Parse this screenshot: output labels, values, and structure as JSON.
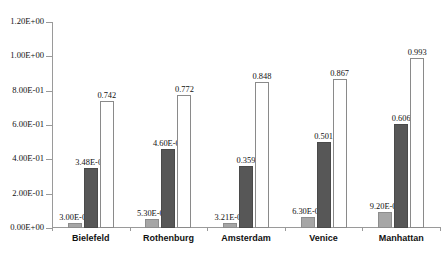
{
  "chart_data": {
    "type": "bar",
    "title": "",
    "xlabel": "",
    "ylabel": "",
    "ylim": [
      0,
      1.2
    ],
    "grid": false,
    "legend": "none",
    "categories": [
      "Bielefeld",
      "Rothenburg",
      "Amsterdam",
      "Venice",
      "Manhattan"
    ],
    "ytick_labels": [
      "1.20E+00",
      "1.00E+00",
      "8.00E-01",
      "6.00E-01",
      "4.00E-01",
      "2.00E-01",
      "0.00E+00"
    ],
    "ytick_values": [
      1.2,
      1.0,
      0.8,
      0.6,
      0.4,
      0.2,
      0.0
    ],
    "series": [
      {
        "name": "series-1",
        "color": "#a6a6a6",
        "values": [
          0.03,
          0.053,
          0.0321,
          0.063,
          0.092
        ],
        "labels": [
          "3.00E-02",
          "5.30E-02",
          "3.21E-02",
          "6.30E-02",
          "9.20E-02"
        ]
      },
      {
        "name": "series-2",
        "color": "#575757",
        "values": [
          0.348,
          0.46,
          0.359,
          0.501,
          0.606
        ],
        "labels": [
          "3.48E-01",
          "4.60E-01",
          "0.359",
          "0.501",
          "0.606"
        ]
      },
      {
        "name": "series-3",
        "color": "#ffffff",
        "values": [
          0.742,
          0.772,
          0.848,
          0.867,
          0.993
        ],
        "labels": [
          "0.742",
          "0.772",
          "0.848",
          "0.867",
          "0.993"
        ]
      }
    ]
  },
  "caption": {
    "text": ""
  }
}
